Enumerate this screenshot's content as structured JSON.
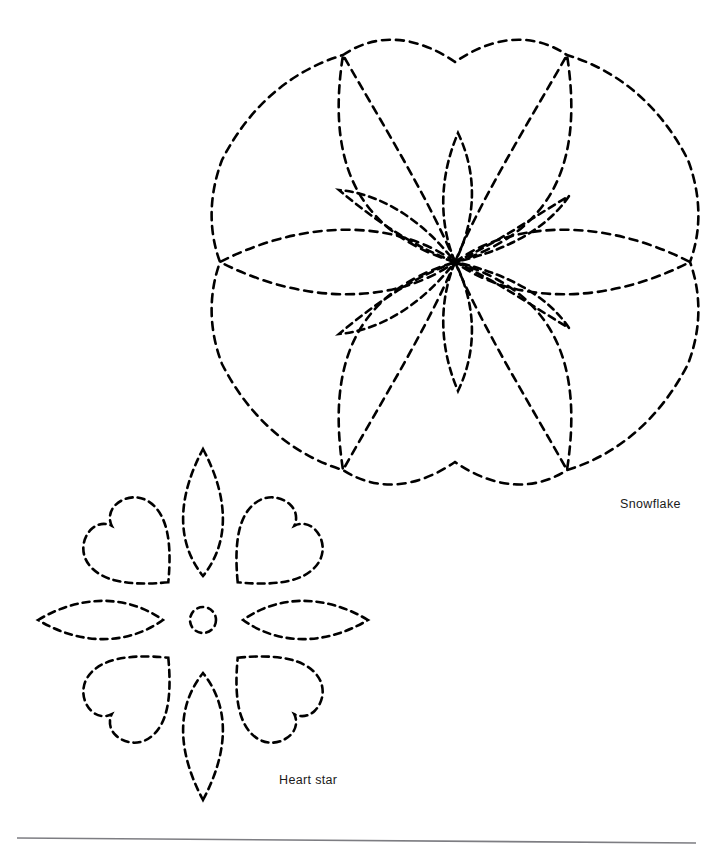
{
  "page": {
    "background_color": "#ffffff",
    "width": 725,
    "height": 850
  },
  "ink": {
    "stroke_color": "#000000",
    "stroke_width": 2.6,
    "dash_pattern": "7 5",
    "rule_color": "#7d7d82"
  },
  "labels": {
    "snowflake": "Snowflake",
    "heart_star": "Heart star"
  },
  "figures": [
    {
      "id": "snowflake",
      "name": "Snowflake",
      "label": "Snowflake",
      "center": [
        455,
        262
      ],
      "outer_radius": 235,
      "petal_count": 6,
      "inner_petal_count": 6,
      "description": "Six-point scalloped snowflake quilting motif drawn in dashed stitch lines with six large pointed petals and six smaller inner petals radiating from a common centre."
    },
    {
      "id": "heart-star",
      "name": "Heart star",
      "label": "Heart star",
      "center": [
        203,
        620
      ],
      "outer_radius": 182,
      "petal_count": 4,
      "heart_count": 4,
      "center_circle_radius": 13,
      "description": "Eight-point star motif drawn in dashed stitch lines: four pointed leaf petals on the vertical and horizontal axes, four hearts on the diagonals, and a small circle at the centre."
    }
  ],
  "rule": {
    "name": "page-rule",
    "x1": 17,
    "y1": 838,
    "x2": 696,
    "y2": 843
  }
}
